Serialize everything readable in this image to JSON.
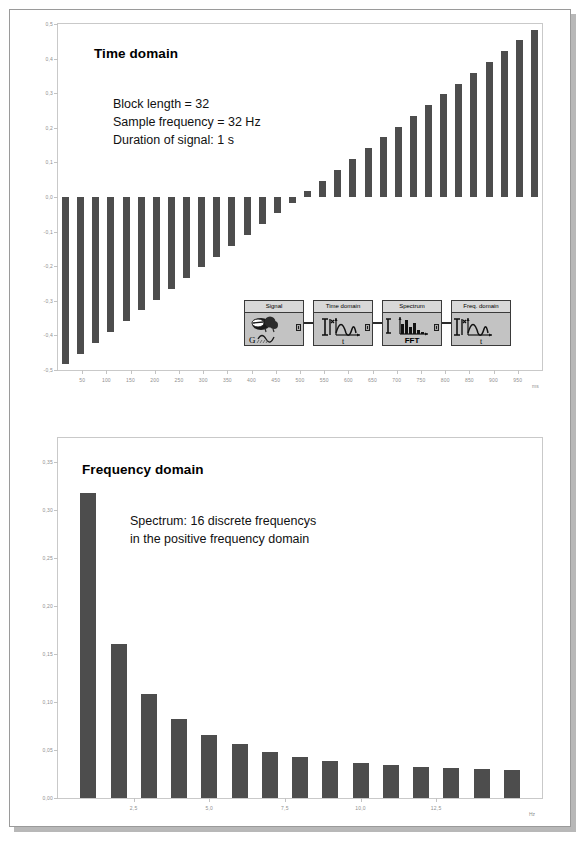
{
  "slide": {
    "background_color": "#ffffff",
    "shadow_color": "#b8b8b8",
    "border_color": "#9a9a9a"
  },
  "palette": {
    "bar_color": "#4d4d4d",
    "axis_color": "#c9c9c9",
    "tick_text_color": "#8f8f8f",
    "text_color": "#111111",
    "diagram_fill": "#c3c3c3",
    "diagram_header": "#d8d8d8",
    "diagram_stroke": "#3a3a3a"
  },
  "time_panel": {
    "title": "Time domain",
    "annotation_lines": [
      "Block length = 32",
      "Sample frequency = 32 Hz",
      "Duration of signal: 1 s"
    ]
  },
  "freq_panel": {
    "title": "Frequency domain",
    "annotation_lines": [
      "Spectrum: 16 discrete frequencys",
      "in the positive frequency domain"
    ]
  },
  "flow_diagram": {
    "blocks": [
      {
        "title": "Signal",
        "glyph": "signal-generator-icon",
        "caption": "G"
      },
      {
        "title": "Time domain",
        "glyph": "waveform-scope-icon",
        "caption": "t"
      },
      {
        "title": "Spectrum",
        "glyph": "fft-bars-icon",
        "caption": "FFT"
      },
      {
        "title": "Freq. domain",
        "glyph": "waveform-scope-icon",
        "caption": "t"
      }
    ]
  },
  "chart_data": [
    {
      "id": "time-domain",
      "type": "bar",
      "title": "Time domain",
      "xlabel": "ms",
      "ylabel": "",
      "xlim": [
        0,
        1000
      ],
      "ylim": [
        -0.5,
        0.5
      ],
      "grid": false,
      "x_ticks": [
        50,
        100,
        150,
        200,
        250,
        300,
        350,
        400,
        450,
        500,
        550,
        600,
        650,
        700,
        750,
        800,
        850,
        900,
        950
      ],
      "x_tick_labels": [
        "50",
        "100",
        "150",
        "200",
        "250",
        "300",
        "350",
        "400",
        "450",
        "500",
        "550",
        "600",
        "650",
        "700",
        "750",
        "800",
        "850",
        "900",
        "950"
      ],
      "y_ticks": [
        0.5,
        0.4,
        0.3,
        0.2,
        0.1,
        0.0,
        -0.1,
        -0.2,
        -0.3,
        -0.4,
        -0.5
      ],
      "y_tick_labels": [
        "0,5",
        "0,4",
        "0,3",
        "0,2",
        "0,1",
        "0,0",
        "-0,1",
        "-0,2",
        "-0,3",
        "-0,4",
        "-0,5"
      ],
      "categories": [
        15.6,
        46.9,
        78.1,
        109.4,
        140.6,
        171.9,
        203.1,
        234.4,
        265.6,
        296.9,
        328.1,
        359.4,
        390.6,
        421.9,
        453.1,
        484.4,
        515.6,
        546.9,
        578.1,
        609.4,
        640.6,
        671.9,
        703.1,
        734.4,
        765.6,
        796.9,
        828.1,
        859.4,
        890.6,
        921.9,
        953.1,
        984.4
      ],
      "values": [
        -0.484,
        -0.453,
        -0.422,
        -0.391,
        -0.359,
        -0.328,
        -0.297,
        -0.266,
        -0.234,
        -0.203,
        -0.172,
        -0.141,
        -0.109,
        -0.078,
        -0.047,
        -0.016,
        0.016,
        0.047,
        0.078,
        0.109,
        0.141,
        0.172,
        0.203,
        0.234,
        0.266,
        0.297,
        0.328,
        0.359,
        0.391,
        0.422,
        0.453,
        0.484
      ],
      "annotations": [
        "Block length = 32",
        "Sample frequency = 32 Hz",
        "Duration of signal: 1 s"
      ]
    },
    {
      "id": "frequency-domain",
      "type": "bar",
      "title": "Frequency domain",
      "xlabel": "Hz",
      "ylabel": "",
      "xlim": [
        0,
        16
      ],
      "ylim": [
        0.0,
        0.375
      ],
      "grid": false,
      "x_ticks": [
        2.5,
        5.0,
        7.5,
        10.0,
        12.5
      ],
      "x_tick_labels": [
        "2,5",
        "5,0",
        "7,5",
        "10,0",
        "12,5"
      ],
      "y_ticks": [
        0.35,
        0.3,
        0.25,
        0.2,
        0.15,
        0.1,
        0.05,
        0.0
      ],
      "y_tick_labels": [
        "0,35",
        "0,30",
        "0,25",
        "0,20",
        "0,15",
        "0,10",
        "0,05",
        "0,00"
      ],
      "categories": [
        1,
        2,
        3,
        4,
        5,
        6,
        7,
        8,
        9,
        10,
        11,
        12,
        13,
        14,
        15
      ],
      "values": [
        0.318,
        0.16,
        0.108,
        0.082,
        0.066,
        0.056,
        0.048,
        0.043,
        0.039,
        0.036,
        0.034,
        0.032,
        0.031,
        0.03,
        0.029
      ],
      "annotations": [
        "Spectrum: 16 discrete frequencys",
        "in the positive frequency domain"
      ]
    }
  ]
}
